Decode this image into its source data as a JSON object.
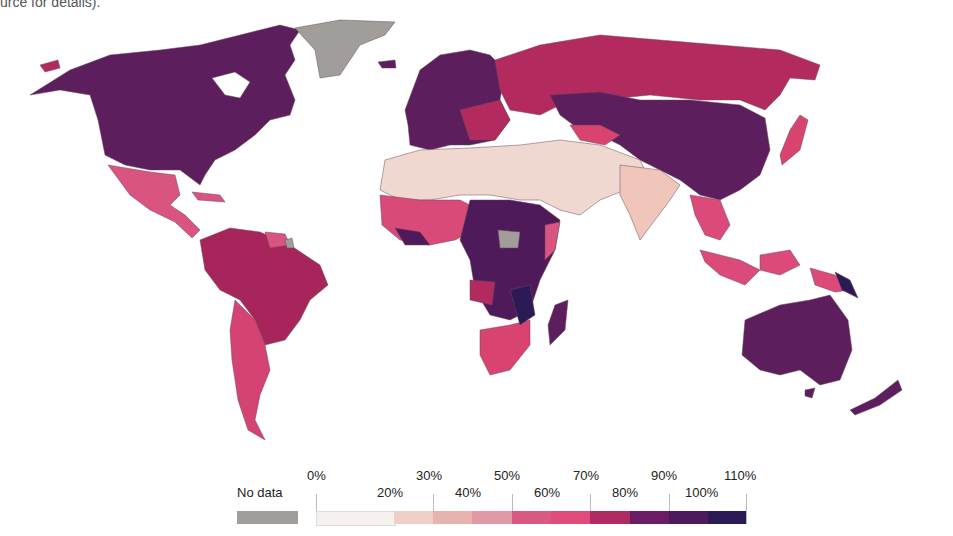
{
  "caption": "urce for details).",
  "colors": {
    "no_data": "#a19d9a",
    "ocean": "#ffffff",
    "border": "#7a5a6a"
  },
  "legend": {
    "no_data_label": "No data",
    "top_labels": [
      "0%",
      "30%",
      "50%",
      "70%",
      "90%",
      "110%"
    ],
    "bottom_labels": [
      "20%",
      "40%",
      "60%",
      "80%",
      "100%"
    ],
    "bins": [
      {
        "range": "0–20%",
        "color": "#f6f0ef"
      },
      {
        "range": "20–30%",
        "color": "#edcfc8"
      },
      {
        "range": "30–40%",
        "color": "#e6b3ae"
      },
      {
        "range": "40–50%",
        "color": "#df98a4"
      },
      {
        "range": "50–60%",
        "color": "#d95981"
      },
      {
        "range": "60–70%",
        "color": "#df4c7c"
      },
      {
        "range": "70–80%",
        "color": "#b02a63"
      },
      {
        "range": "80–90%",
        "color": "#6a1d66"
      },
      {
        "range": "90–100%",
        "color": "#4e1a5e"
      },
      {
        "range": "100–110%",
        "color": "#2b1a55"
      }
    ]
  },
  "regions": [
    {
      "name": "North America",
      "color": "#5c1e5c"
    },
    {
      "name": "Greenland",
      "color": "#a19d9a"
    },
    {
      "name": "Mexico / Central America",
      "color": "#d9547f"
    },
    {
      "name": "South America (north/Brazil)",
      "color": "#a8255c"
    },
    {
      "name": "South America (Argentina/Chile)",
      "color": "#d44372"
    },
    {
      "name": "Europe",
      "color": "#5c1e5c"
    },
    {
      "name": "Russia",
      "color": "#b32a5f"
    },
    {
      "name": "North Africa / Middle East",
      "color": "#f0d7d0"
    },
    {
      "name": "West Africa",
      "color": "#d94a78"
    },
    {
      "name": "Central / East Africa",
      "color": "#4e1a5a"
    },
    {
      "name": "Southern Africa",
      "color": "#d9436f"
    },
    {
      "name": "Madagascar",
      "color": "#5c1e5c"
    },
    {
      "name": "Central Asia / China",
      "color": "#5c1e5c"
    },
    {
      "name": "India",
      "color": "#efc6b9"
    },
    {
      "name": "Southeast Asia",
      "color": "#db4a78"
    },
    {
      "name": "Japan",
      "color": "#d9436f"
    },
    {
      "name": "Australia / NZ",
      "color": "#5c1e5c"
    }
  ]
}
